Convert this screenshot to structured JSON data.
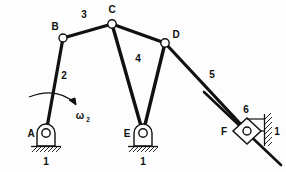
{
  "diagram": {
    "background_color": "#fdfdfd",
    "line_color": "#111111",
    "joint_fill_color": "#ffffff",
    "joints": [
      {
        "id": "A",
        "label": "A",
        "x": 46,
        "y": 133,
        "type": "ground-pivot"
      },
      {
        "id": "B",
        "label": "B",
        "x": 63,
        "y": 38,
        "type": "pin"
      },
      {
        "id": "C",
        "label": "C",
        "x": 112,
        "y": 24,
        "type": "pin"
      },
      {
        "id": "D",
        "label": "D",
        "x": 165,
        "y": 43,
        "type": "pin"
      },
      {
        "id": "E",
        "label": "E",
        "x": 143,
        "y": 133,
        "type": "ground-pivot"
      },
      {
        "id": "F",
        "label": "F",
        "x": 247,
        "y": 131,
        "type": "slider-pin"
      }
    ],
    "links": [
      {
        "id": "2",
        "label": "2",
        "from": "A",
        "to": "B",
        "label_x": 64,
        "label_y": 79
      },
      {
        "id": "3",
        "label": "3",
        "from": "B",
        "to": "C",
        "label_x": 84,
        "label_y": 18
      },
      {
        "id": "4",
        "label": "4",
        "shape": "ternary-triangle",
        "vertices": [
          "C",
          "D",
          "E"
        ],
        "label_x": 138,
        "label_y": 62
      },
      {
        "id": "5",
        "label": "5",
        "from": "D",
        "to": "F",
        "label_x": 212,
        "label_y": 78
      },
      {
        "id": "6",
        "label": "6",
        "at": "F",
        "label_x": 246,
        "label_y": 113
      }
    ],
    "ground_labels": [
      {
        "label": "1",
        "x": 46,
        "y": 163,
        "at": "A"
      },
      {
        "label": "1",
        "x": 143,
        "y": 163,
        "at": "E"
      },
      {
        "label": "1",
        "x": 274,
        "y": 134,
        "at": "F"
      }
    ],
    "input_motion": {
      "label": "ω",
      "subscript": "2",
      "label_x": 80,
      "label_y": 119,
      "direction": "clockwise",
      "applies_to_link": "2"
    }
  }
}
